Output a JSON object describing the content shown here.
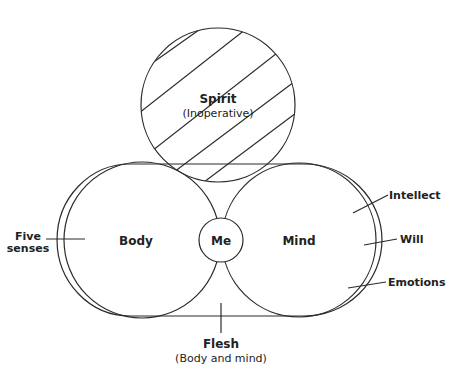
{
  "diagram": {
    "spirit": {
      "title": "Spirit",
      "subtitle": "(Inoperative)",
      "hatched": true
    },
    "body": {
      "label": "Body"
    },
    "me": {
      "label": "Me"
    },
    "mind": {
      "label": "Mind"
    },
    "flesh": {
      "title": "Flesh",
      "subtitle": "(Body and mind)"
    },
    "annotations": {
      "left": {
        "line1": "Five",
        "line2": "senses"
      },
      "right": [
        "Intellect",
        "Will",
        "Emotions"
      ]
    },
    "colors": {
      "stroke": "#2a2a2a",
      "text": "#222222",
      "background": "#ffffff"
    }
  }
}
